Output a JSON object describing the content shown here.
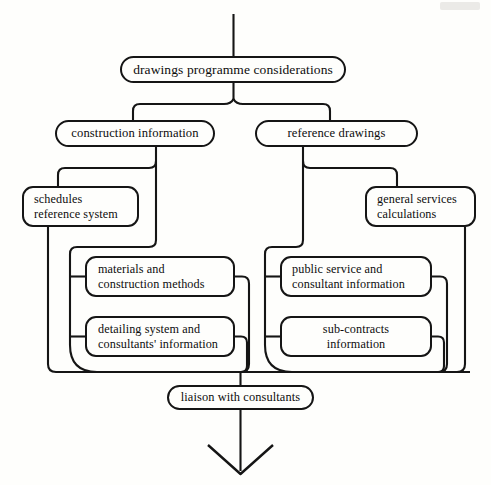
{
  "diagram": {
    "ink_color": "#151515",
    "paper_color": "#fefefc",
    "nodes": {
      "top": {
        "line1": "drawings programme considerations"
      },
      "construction": {
        "line1": "construction information"
      },
      "reference": {
        "line1": "reference drawings"
      },
      "schedules": {
        "line1": "schedules",
        "line2": "reference system"
      },
      "general": {
        "line1": "general services",
        "line2": "calculations"
      },
      "materials": {
        "line1": "materials and",
        "line2": "construction methods"
      },
      "public": {
        "line1": "public service and",
        "line2": "consultant information"
      },
      "detailing": {
        "line1": "detailing system and",
        "line2": "consultants' information"
      },
      "subcontracts": {
        "line1": "sub-contracts",
        "line2": "information"
      },
      "liaison": {
        "line1": "liaison with consultants"
      }
    }
  }
}
